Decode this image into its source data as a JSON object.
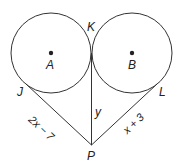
{
  "diagram": {
    "points": {
      "A": "A",
      "B": "B",
      "K": "K",
      "J": "J",
      "L": "L",
      "P": "P"
    },
    "segments": {
      "JP": "2x − 7",
      "LP": "x + 3",
      "KP": "y"
    },
    "colors": {
      "stroke": "#333333",
      "background": "#ffffff"
    }
  }
}
